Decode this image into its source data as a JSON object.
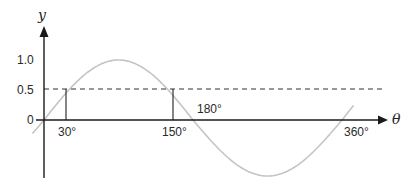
{
  "chart_data": {
    "type": "line",
    "title": "",
    "xlabel": "θ",
    "ylabel": "y",
    "function": "y = sin θ",
    "x_ticks": [
      "30°",
      "150°",
      "180°",
      "360°"
    ],
    "y_ticks": [
      "0",
      "0.5",
      "1.0"
    ],
    "xlim": [
      -15,
      370
    ],
    "ylim": [
      -1,
      1
    ],
    "grid": false,
    "series": [
      {
        "name": "sin θ",
        "x": [
          -15,
          0,
          30,
          90,
          150,
          180,
          270,
          360,
          375
        ],
        "values": [
          -0.26,
          0,
          0.5,
          1.0,
          0.5,
          0,
          -1.0,
          0,
          0.26
        ],
        "color": "#c4c4c4"
      },
      {
        "name": "y = 0.5 (dashed)",
        "x": [
          0,
          390
        ],
        "values": [
          0.5,
          0.5
        ],
        "color": "#333333"
      }
    ],
    "annotations": [
      {
        "type": "vertical-line",
        "x": 30,
        "from": 0,
        "to": 0.5,
        "label": "30°"
      },
      {
        "type": "vertical-line",
        "x": 150,
        "from": 0,
        "to": 0.5,
        "label": "150°"
      },
      {
        "type": "point-label",
        "x": 180,
        "y": 0,
        "label": "180°"
      },
      {
        "type": "point-label",
        "x": 360,
        "y": 0,
        "label": "360°"
      }
    ]
  },
  "labels": {
    "y_axis": "y",
    "x_axis": "θ",
    "y_tick_1": "1.0",
    "y_tick_05": "0.5",
    "y_tick_0": "0",
    "x_30": "30°",
    "x_150": "150°",
    "x_180": "180°",
    "x_360": "360°"
  },
  "colors": {
    "axis": "#1a1a1a",
    "curve": "#c4c4c4",
    "dashed": "#333333"
  }
}
